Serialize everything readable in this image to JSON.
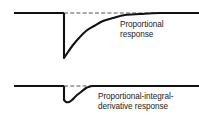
{
  "figure": {
    "background_color": "#ffffff",
    "stroke_color": "#111111",
    "baseline_dash_color": "#555555",
    "text_color": "#1a1a1a",
    "annotations": {
      "proportional": {
        "line1": "Proportional",
        "line2": "response",
        "full_text": "Proportional response"
      },
      "pid": {
        "line1": "Proportional-integral-",
        "line2": "derivative response",
        "full_text": "Proportional-integral-derivative response"
      }
    }
  },
  "chart_data": [
    {
      "type": "line",
      "name": "proportional-response",
      "title": "Proportional response",
      "xlabel": "",
      "ylabel": "",
      "grid": false,
      "legend": "inline-annotation",
      "xlim": [
        0,
        199
      ],
      "ylim": [
        0,
        65
      ],
      "setpoint_baseline_y": 13,
      "disturbance_x": 64,
      "min_value_y": 58,
      "series": [
        {
          "name": "pre-disturbance-baseline",
          "style": "solid",
          "x": [
            14,
            64
          ],
          "y": [
            13,
            13
          ]
        },
        {
          "name": "step-drop",
          "style": "solid",
          "x": [
            64,
            64
          ],
          "y": [
            13,
            58
          ]
        },
        {
          "name": "exponential-recovery",
          "style": "solid",
          "x": [
            64,
            68,
            73,
            79,
            86,
            94,
            103,
            113,
            125,
            140,
            160,
            199
          ],
          "y": [
            58,
            52,
            45,
            38,
            31,
            26,
            21,
            18,
            15,
            14,
            13,
            13
          ]
        },
        {
          "name": "setpoint-reference",
          "style": "dashed",
          "x": [
            64,
            199
          ],
          "y": [
            13,
            13
          ]
        }
      ]
    },
    {
      "type": "line",
      "name": "pid-response",
      "title": "Proportional-integral-derivative response",
      "xlabel": "",
      "ylabel": "",
      "grid": false,
      "legend": "inline-annotation",
      "xlim": [
        0,
        199
      ],
      "ylim": [
        65,
        119
      ],
      "setpoint_baseline_y": 86,
      "disturbance_x": 64,
      "min_value_y": 102,
      "series": [
        {
          "name": "pre-disturbance-baseline",
          "style": "solid",
          "x": [
            14,
            64
          ],
          "y": [
            86,
            86
          ]
        },
        {
          "name": "step-drop",
          "style": "solid",
          "x": [
            64,
            64
          ],
          "y": [
            86,
            100
          ]
        },
        {
          "name": "fast-recovery",
          "style": "solid",
          "x": [
            64,
            66,
            69,
            72,
            76,
            81,
            86,
            90,
            93,
            110,
            150,
            199
          ],
          "y": [
            100,
            102,
            102,
            100,
            96,
            92,
            88,
            86.5,
            86,
            86,
            86,
            86
          ]
        },
        {
          "name": "setpoint-reference",
          "style": "dashed",
          "x": [
            64,
            199
          ],
          "y": [
            86,
            86
          ]
        }
      ]
    }
  ]
}
